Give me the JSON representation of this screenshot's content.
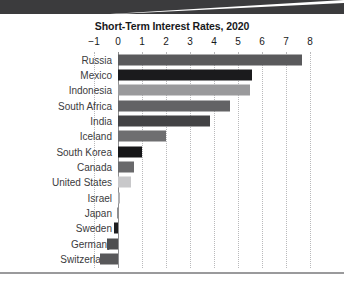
{
  "banner": {
    "label": "top-banner-strip"
  },
  "chart_data": {
    "type": "bar",
    "orientation": "horizontal",
    "title": "Short-Term Interest Rates, 2020",
    "xlabel": "",
    "ylabel": "",
    "xlim": [
      -1,
      8
    ],
    "xticks": [
      "−1",
      "0",
      "1",
      "2",
      "3",
      "4",
      "5",
      "6",
      "7",
      "8"
    ],
    "xtick_values": [
      -1,
      0,
      1,
      2,
      3,
      4,
      5,
      6,
      7,
      8
    ],
    "grid": "vertical-dotted",
    "legend": "none",
    "categories": [
      "Russia",
      "Mexico",
      "Indonesia",
      "South Africa",
      "India",
      "Iceland",
      "South Korea",
      "Canada",
      "United States",
      "Israel",
      "Japan",
      "Sweden",
      "Germany",
      "Switzerland"
    ],
    "values": [
      7.67,
      5.6,
      5.5,
      4.65,
      3.85,
      2.0,
      1.0,
      0.65,
      0.55,
      0.1,
      -0.05,
      -0.15,
      -0.45,
      -0.75
    ],
    "bar_colors": [
      "#5a5a5c",
      "#1b1b1d",
      "#9a9a9c",
      "#636365",
      "#424244",
      "#6e6e70",
      "#161618",
      "#69696b",
      "#c8c8ca",
      "#b0b0b2",
      "#8e8e90",
      "#1f1f21",
      "#4e4e50",
      "#58585a"
    ]
  },
  "colors": {
    "banner": "#3b3b3d",
    "title_text": "#18191b",
    "label_text": "#3b3b3d",
    "gridline": "#b9b9bb",
    "zero_axis": "#8e8e90",
    "background": "#ffffff",
    "bottom_rule": "#9a9a9c"
  }
}
